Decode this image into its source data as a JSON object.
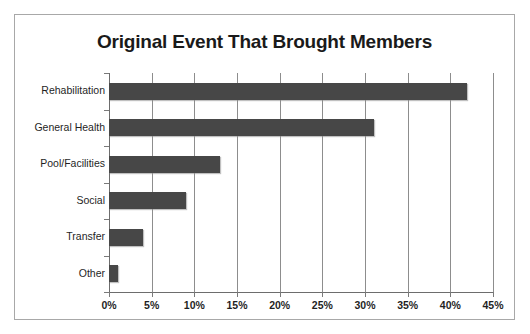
{
  "chart_data": {
    "type": "bar",
    "orientation": "horizontal",
    "title": "Original Event That Brought Members",
    "xlabel": "",
    "ylabel": "",
    "categories": [
      "Rehabilitation",
      "General Health",
      "Pool/Facilities",
      "Social",
      "Transfer",
      "Other"
    ],
    "values": [
      42,
      31,
      13,
      9,
      4,
      1
    ],
    "value_unit": "%",
    "xlim": [
      0,
      45
    ],
    "xticks": [
      0,
      5,
      10,
      15,
      20,
      25,
      30,
      35,
      40,
      45
    ],
    "xtick_labels": [
      "0%",
      "5%",
      "10%",
      "15%",
      "20%",
      "25%",
      "30%",
      "35%",
      "40%",
      "45%"
    ],
    "grid": "vertical",
    "legend": "none",
    "series": [
      {
        "name": "Original Event That Brought Members",
        "color": "#474747",
        "values": [
          42,
          31,
          13,
          9,
          4,
          1
        ]
      }
    ],
    "colors": {
      "bar": "#474747",
      "gridline": "#8d8d8d",
      "axis": "#6d6d6d",
      "frame": "#a8a8a8",
      "text": "#1f1f1f",
      "background": "#ffffff"
    }
  }
}
